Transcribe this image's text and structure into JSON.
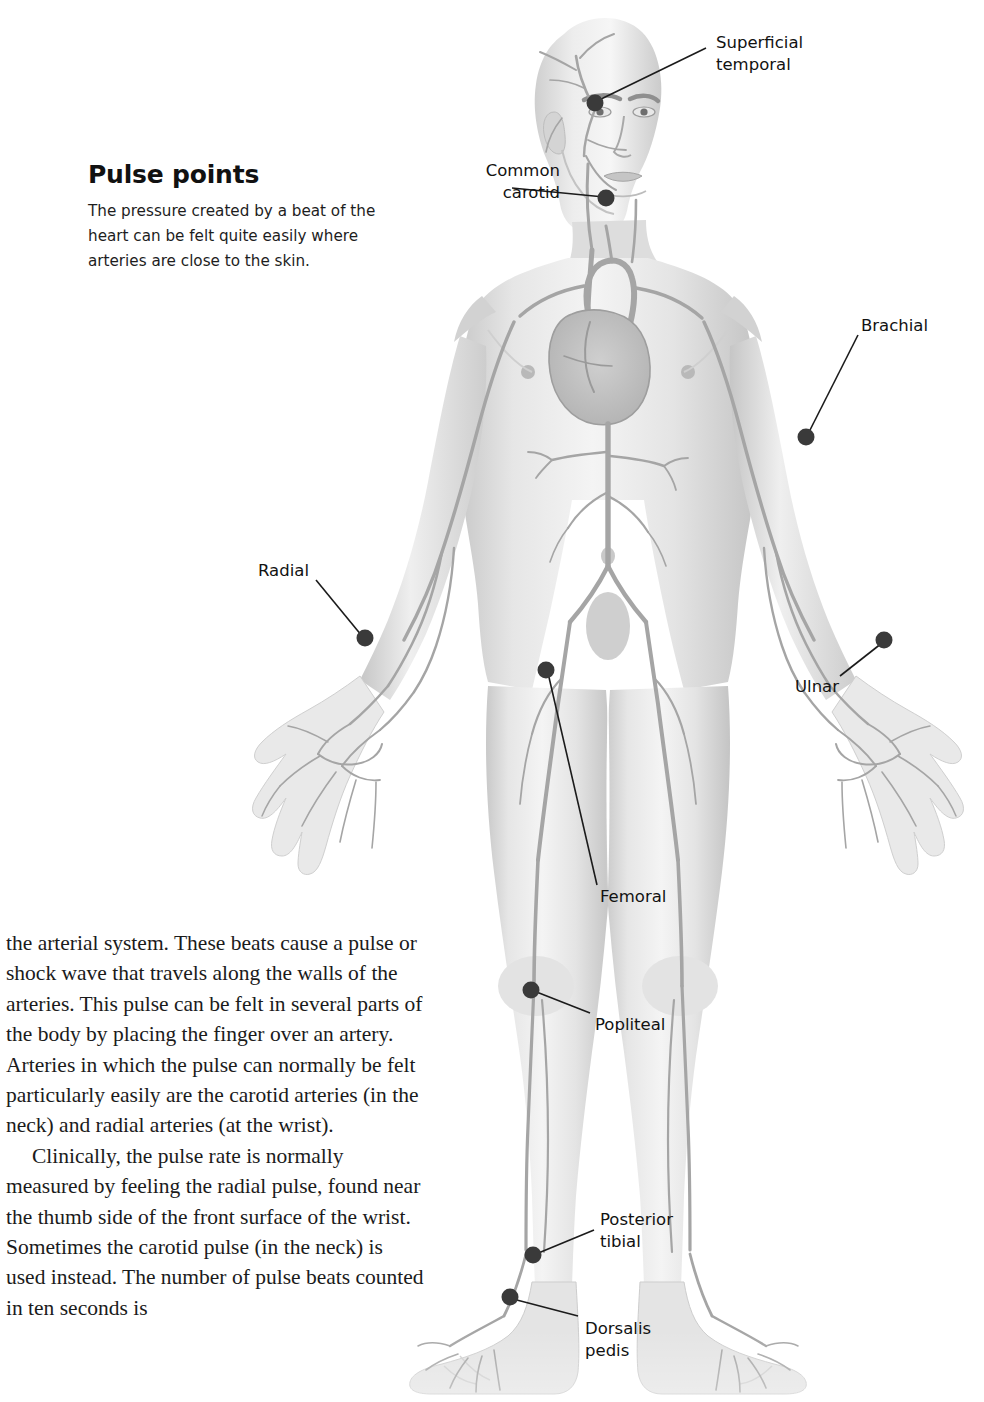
{
  "page": {
    "width": 984,
    "height": 1402,
    "background": "#ffffff"
  },
  "callout": {
    "title": "Pulse points",
    "body": "The pressure created by a beat of the heart can be felt quite easily where arteries are close to the skin."
  },
  "body_copy": {
    "paragraphs": [
      "the arterial system. These beats cause a pulse or shock wave that travels along the walls of the arteries. This pulse can be felt in several parts of the body by placing the finger over an artery. Arteries in which the pulse can normally be felt particularly easily are the carotid arteries (in the neck) and radial arteries (at the wrist).",
      "Clinically, the pulse rate is normally measured by feeling the radial pulse, found near the thumb side of the front surface of the wrist. Sometimes the carotid pulse (in the neck) is used instead. The number of pulse beats counted in ten seconds is"
    ]
  },
  "labels": [
    {
      "id": "superficial-temporal",
      "text": "Superficial\ntemporal",
      "align": "left",
      "x": 716,
      "y": 32,
      "dot": {
        "x": 595,
        "y": 103
      },
      "line": {
        "x1": 706,
        "y1": 48,
        "x2": 597,
        "y2": 101
      }
    },
    {
      "id": "common-carotid",
      "text": "Common\ncarotid",
      "align": "right",
      "x": 440,
      "y": 160,
      "dot": {
        "x": 606,
        "y": 198
      },
      "line": {
        "x1": 512,
        "y1": 188,
        "x2": 604,
        "y2": 197
      }
    },
    {
      "id": "brachial",
      "text": "Brachial",
      "align": "left",
      "x": 861,
      "y": 315,
      "dot": {
        "x": 806,
        "y": 437
      },
      "line": {
        "x1": 858,
        "y1": 335,
        "x2": 808,
        "y2": 434
      }
    },
    {
      "id": "radial",
      "text": "Radial",
      "align": "left",
      "x": 258,
      "y": 560,
      "dot": {
        "x": 365,
        "y": 638
      },
      "line": {
        "x1": 316,
        "y1": 580,
        "x2": 362,
        "y2": 636
      }
    },
    {
      "id": "ulnar",
      "text": "Ulnar",
      "align": "left",
      "x": 795,
      "y": 676,
      "dot": {
        "x": 884,
        "y": 640
      },
      "line": {
        "x1": 840,
        "y1": 676,
        "x2": 882,
        "y2": 643
      }
    },
    {
      "id": "femoral",
      "text": "Femoral",
      "align": "left",
      "x": 600,
      "y": 886,
      "dot": {
        "x": 546,
        "y": 670
      },
      "line": {
        "x1": 597,
        "y1": 885,
        "x2": 548,
        "y2": 673
      }
    },
    {
      "id": "popliteal",
      "text": "Popliteal",
      "align": "left",
      "x": 595,
      "y": 1014,
      "dot": {
        "x": 531,
        "y": 990
      },
      "line": {
        "x1": 590,
        "y1": 1013,
        "x2": 534,
        "y2": 991
      }
    },
    {
      "id": "posterior-tibial",
      "text": "Posterior\ntibial",
      "align": "left",
      "x": 600,
      "y": 1209,
      "dot": {
        "x": 533,
        "y": 1255
      },
      "line": {
        "x1": 594,
        "y1": 1230,
        "x2": 536,
        "y2": 1254
      }
    },
    {
      "id": "dorsalis-pedis",
      "text": "Dorsalis\npedis",
      "align": "left",
      "x": 585,
      "y": 1318,
      "dot": {
        "x": 510,
        "y": 1297
      },
      "line": {
        "x1": 578,
        "y1": 1316,
        "x2": 513,
        "y2": 1299
      }
    }
  ],
  "colors": {
    "dot": "#3a3a3a",
    "leader_line": "#1b1b1b",
    "skin_light": "#f2f2f2",
    "skin_mid": "#d8d8d8",
    "skin_shadow": "#bdbdbd",
    "artery": "#a9a9a9",
    "text": "#1a1a1a"
  },
  "figure": {
    "name": "anterior-arterial-system-figure"
  }
}
